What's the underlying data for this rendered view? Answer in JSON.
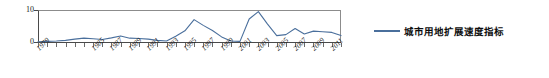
{
  "chart_data": {
    "type": "line",
    "title": "",
    "subtitle": "",
    "xlabel": "",
    "ylabel": "",
    "grid": false,
    "legend_position": "right",
    "ylim": [
      0,
      10
    ],
    "yticks": [
      0,
      10
    ],
    "ytick_labels": [
      "0",
      "10"
    ],
    "xlim": [
      1979,
      2012
    ],
    "xtick_labels": [
      "1979",
      "1985",
      "1987",
      "1989",
      "1991",
      "1993",
      "1995",
      "1997",
      "1999",
      "2001",
      "2003",
      "2005",
      "2007",
      "2009",
      "2011"
    ],
    "x": [
      1979,
      1980,
      1981,
      1982,
      1983,
      1984,
      1985,
      1986,
      1987,
      1988,
      1989,
      1990,
      1991,
      1992,
      1993,
      1994,
      1995,
      1996,
      1997,
      1998,
      1999,
      2000,
      2001,
      2002,
      2003,
      2004,
      2005,
      2006,
      2007,
      2008,
      2009,
      2010,
      2011,
      2012
    ],
    "series": [
      {
        "name": "城市用地扩展速度指标",
        "color": "#4a6f9c",
        "values": [
          0.1,
          0.2,
          0.3,
          0.5,
          0.9,
          1.2,
          1.0,
          0.8,
          1.3,
          1.9,
          1.2,
          1.1,
          0.9,
          0.5,
          0.3,
          1.8,
          3.5,
          7.0,
          5.2,
          3.6,
          1.6,
          0.3,
          0.2,
          7.2,
          9.5,
          5.6,
          2.0,
          2.3,
          4.2,
          2.5,
          3.4,
          3.2,
          3.0,
          2.0
        ]
      }
    ],
    "series_extra_points": [
      2.1,
      5.3,
      4.0,
      3.6,
      6.2,
      3.2,
      1.2,
      4.8,
      5.0,
      3.9,
      5.1,
      8.0
    ],
    "legend": [
      {
        "label": "城市用地扩展速度指标",
        "color": "#4a6f9c"
      }
    ]
  },
  "axis": {
    "y_top_label": "10",
    "y_bottom_label": "0"
  }
}
